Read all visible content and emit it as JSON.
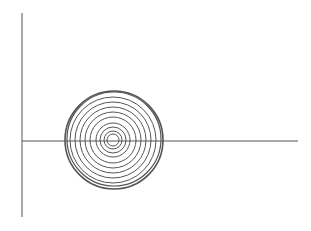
{
  "figure": {
    "width": 311,
    "height": 231,
    "background": "#ffffff",
    "stroke_color": "#555555",
    "axes": {
      "vertical": {
        "x": 22,
        "y1": 13,
        "y2": 217
      },
      "horizontal": {
        "y": 141,
        "x1": 22,
        "x2": 298
      }
    },
    "rings": [
      {
        "cx": 114,
        "cy": 140,
        "r": 49,
        "w": 1.6
      },
      {
        "cx": 114,
        "cy": 139,
        "r": 47,
        "w": 1.2
      },
      {
        "cx": 113,
        "cy": 140,
        "r": 43,
        "w": 1
      },
      {
        "cx": 113,
        "cy": 140,
        "r": 38,
        "w": 1
      },
      {
        "cx": 113,
        "cy": 140,
        "r": 33,
        "w": 1
      },
      {
        "cx": 113,
        "cy": 140,
        "r": 28,
        "w": 1
      },
      {
        "cx": 113,
        "cy": 140,
        "r": 23,
        "w": 1
      },
      {
        "cx": 113,
        "cy": 140,
        "r": 17,
        "w": 1
      },
      {
        "cx": 113,
        "cy": 140,
        "r": 13,
        "w": 1
      },
      {
        "cx": 113,
        "cy": 140,
        "r": 9,
        "w": 1
      },
      {
        "cx": 113,
        "cy": 140,
        "r": 6,
        "w": 1
      }
    ]
  }
}
